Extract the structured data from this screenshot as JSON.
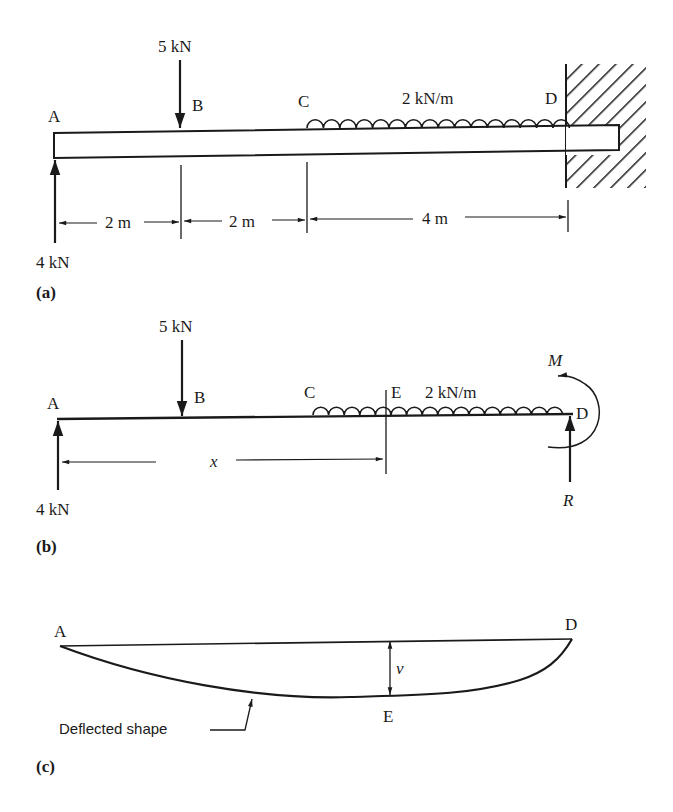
{
  "figure_a": {
    "panel_label": "(a)",
    "points": {
      "A": "A",
      "B": "B",
      "C": "C",
      "D": "D"
    },
    "point_load": "5 kN",
    "distributed_load": "2 kN/m",
    "reaction": "4 kN",
    "dimensions": [
      "2 m",
      "2 m",
      "4 m"
    ]
  },
  "figure_b": {
    "panel_label": "(b)",
    "points": {
      "A": "A",
      "B": "B",
      "C": "C",
      "E": "E",
      "D": "D"
    },
    "point_load": "5 kN",
    "distributed_load": "2 kN/m",
    "reaction_left": "4 kN",
    "moment": "M",
    "reaction_right": "R",
    "dimension": "x"
  },
  "figure_c": {
    "panel_label": "(c)",
    "points": {
      "A": "A",
      "D": "D",
      "E": "E"
    },
    "deflection": "v",
    "caption": "Deflected shape"
  }
}
